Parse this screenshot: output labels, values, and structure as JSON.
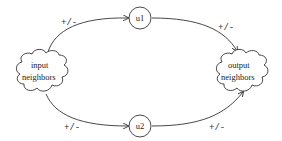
{
  "diagram": {
    "nodes": [
      {
        "id": "input",
        "shape": "cloud",
        "lines": [
          "input",
          "neighbors"
        ]
      },
      {
        "id": "u1",
        "shape": "circle",
        "label": "u1"
      },
      {
        "id": "u2",
        "shape": "circle",
        "label": "u2"
      },
      {
        "id": "output",
        "shape": "cloud",
        "lines": [
          "output",
          "neighbors"
        ]
      }
    ],
    "edges": [
      {
        "from": "input",
        "to": "u1",
        "label": "+/-"
      },
      {
        "from": "u1",
        "to": "output",
        "label": "+/-"
      },
      {
        "from": "input",
        "to": "u2",
        "label": "+/-"
      },
      {
        "from": "u2",
        "to": "output",
        "label": "+/-"
      }
    ],
    "colors": {
      "stroke": "#333333",
      "background": "#ffffff"
    }
  }
}
